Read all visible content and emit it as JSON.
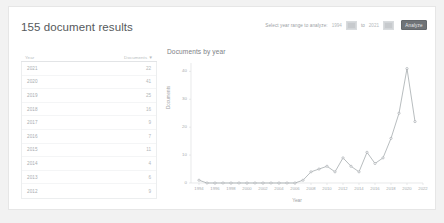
{
  "header": {
    "title": "155 document results",
    "year_range_label": "Select year range to analyze:",
    "from_value": "1994",
    "to_word": "to",
    "to_value": "2021",
    "analyze_label": "Analyze"
  },
  "table": {
    "columns": [
      "Year",
      "Documents"
    ],
    "sort_indicator": "▼",
    "rows": [
      {
        "year": "2021",
        "documents": "22"
      },
      {
        "year": "2020",
        "documents": "41"
      },
      {
        "year": "2019",
        "documents": "25"
      },
      {
        "year": "2018",
        "documents": "16"
      },
      {
        "year": "2017",
        "documents": "9"
      },
      {
        "year": "2016",
        "documents": "7"
      },
      {
        "year": "2015",
        "documents": "11"
      },
      {
        "year": "2014",
        "documents": "4"
      },
      {
        "year": "2013",
        "documents": "6"
      },
      {
        "year": "2012",
        "documents": "9"
      }
    ]
  },
  "chart_data": {
    "type": "line",
    "title": "Documents by year",
    "xlabel": "Year",
    "ylabel": "Documents",
    "xlim": [
      1993,
      2022
    ],
    "ylim": [
      0,
      43
    ],
    "yticks": [
      0,
      10,
      20,
      30,
      40
    ],
    "xticks": [
      1994,
      1996,
      1998,
      2000,
      2002,
      2004,
      2006,
      2008,
      2010,
      2012,
      2014,
      2016,
      2018,
      2020,
      2022
    ],
    "grid": false,
    "legend": "none",
    "marker": "circle",
    "line_color": "#9aa0a4",
    "x": [
      1994,
      1995,
      1996,
      1997,
      1998,
      1999,
      2000,
      2001,
      2002,
      2003,
      2004,
      2005,
      2006,
      2007,
      2008,
      2009,
      2010,
      2011,
      2012,
      2013,
      2014,
      2015,
      2016,
      2017,
      2018,
      2019,
      2020,
      2021
    ],
    "values": [
      1,
      0,
      0,
      0,
      0,
      0,
      0,
      0,
      0,
      0,
      0,
      0,
      0,
      1,
      4,
      5,
      6,
      4,
      9,
      6,
      4,
      11,
      7,
      9,
      16,
      25,
      41,
      22
    ]
  }
}
